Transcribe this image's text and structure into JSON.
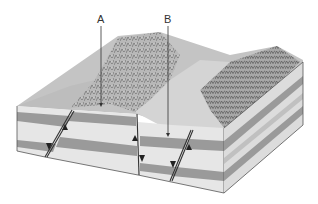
{
  "diagram": {
    "type": "geologic-block-diagram",
    "labels": [
      {
        "id": "A",
        "text": "A",
        "points_to": "uplifted block surface (horst)"
      },
      {
        "id": "B",
        "text": "B",
        "points_to": "down-dropped block surface (graben)"
      }
    ],
    "colors": {
      "light_layer": "#e6e6e6",
      "dark_layer": "#9a9a9a",
      "terrain": "#b5b5b5",
      "outline": "#444444"
    }
  }
}
